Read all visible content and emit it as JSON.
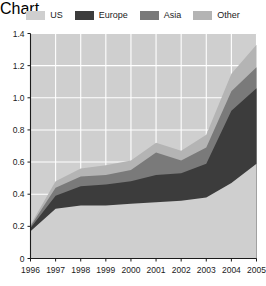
{
  "chart_data": {
    "type": "area",
    "stacked": true,
    "title": "",
    "subtitle": "",
    "xlabel": "",
    "ylabel": "",
    "categories": [
      "1996",
      "1997",
      "1998",
      "1999",
      "2000",
      "2001",
      "2002",
      "2003",
      "2004",
      "2005"
    ],
    "x": [
      1996,
      1997,
      1998,
      1999,
      2000,
      2001,
      2002,
      2003,
      2004,
      2005
    ],
    "xlim": [
      1996,
      2005
    ],
    "ylim": [
      0,
      1.4
    ],
    "yticks": [
      0,
      0.2,
      0.4,
      0.6,
      0.8,
      1.0,
      1.2,
      1.4
    ],
    "ytick_labels": [
      "0",
      "0.2",
      "0.4",
      "0.6",
      "0.8",
      "1.0",
      "1.2",
      "1.4"
    ],
    "xticks": [
      1996,
      1997,
      1998,
      1999,
      2000,
      2001,
      2002,
      2003,
      2004,
      2005
    ],
    "xtick_labels": [
      "1996",
      "1997",
      "1998",
      "1999",
      "2000",
      "2001",
      "2002",
      "2003",
      "2004",
      "2005"
    ],
    "grid": true,
    "grid_color": "#ffffff",
    "grid_axis": "both",
    "plot_background": "#cfcfcf",
    "legend_position": "top",
    "series": [
      {
        "name": "US",
        "color": "#cfcfcf",
        "values": [
          0.17,
          0.31,
          0.33,
          0.33,
          0.34,
          0.35,
          0.36,
          0.38,
          0.47,
          0.59
        ]
      },
      {
        "name": "Europe",
        "color": "#3c3c3c",
        "values": [
          0.02,
          0.08,
          0.12,
          0.13,
          0.14,
          0.17,
          0.17,
          0.21,
          0.45,
          0.47
        ]
      },
      {
        "name": "Asia",
        "color": "#7a7a7a",
        "values": [
          0.01,
          0.05,
          0.06,
          0.06,
          0.07,
          0.14,
          0.08,
          0.1,
          0.12,
          0.13
        ]
      },
      {
        "name": "Other",
        "color": "#b4b4b4",
        "values": [
          0.01,
          0.04,
          0.05,
          0.06,
          0.06,
          0.06,
          0.06,
          0.08,
          0.11,
          0.14
        ]
      }
    ],
    "cumulative_totals": [
      0.21,
      0.48,
      0.56,
      0.58,
      0.61,
      0.72,
      0.67,
      0.77,
      1.15,
      1.33
    ]
  },
  "legend": {
    "items": [
      {
        "label": "US",
        "color": "#cfcfcf"
      },
      {
        "label": "Europe",
        "color": "#3c3c3c"
      },
      {
        "label": "Asia",
        "color": "#7a7a7a"
      },
      {
        "label": "Other",
        "color": "#b4b4b4"
      }
    ]
  },
  "axes": {
    "y_tick_labels": [
      "1.4",
      "1.2",
      "1.0",
      "0.8",
      "0.6",
      "0.4",
      "0.2",
      "0"
    ],
    "x_tick_labels": [
      "1996",
      "1997",
      "1998",
      "1999",
      "2000",
      "2001",
      "2002",
      "2003",
      "2004",
      "2005"
    ]
  }
}
